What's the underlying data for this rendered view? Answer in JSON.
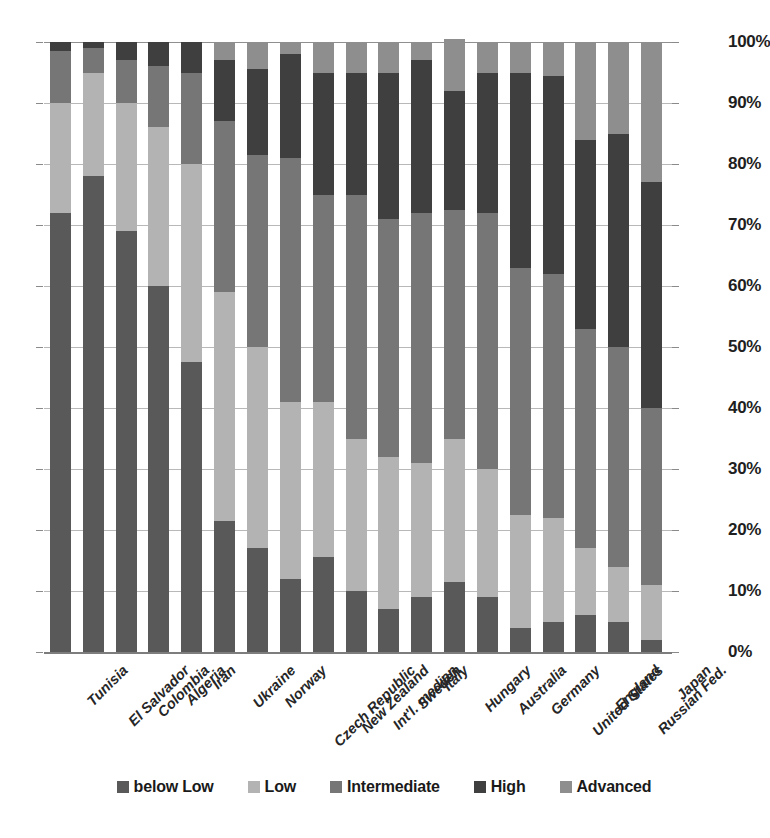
{
  "chart_data": {
    "type": "bar",
    "subtype": "stacked-100-percent",
    "title": "",
    "xlabel": "",
    "ylabel": "",
    "ylim": [
      0,
      100
    ],
    "ytick_labels": [
      "100%",
      "90%",
      "80%",
      "70%",
      "60%",
      "50%",
      "40%",
      "30%",
      "20%",
      "10%",
      "0%"
    ],
    "ytick_values": [
      100,
      90,
      80,
      70,
      60,
      50,
      40,
      30,
      20,
      10,
      0
    ],
    "grid": true,
    "legend_position": "bottom",
    "categories": [
      "Tunisia",
      "El Salvador",
      "Colombia",
      "Algeria",
      "Iran",
      "Ukraine",
      "Norway",
      "Czech Republic",
      "New Zealand",
      "Int'l. median",
      "Sweden",
      "Italy",
      "Hungary",
      "Australia",
      "Germany",
      "United States",
      "England",
      "Russian Fed.",
      "Japan"
    ],
    "series": [
      {
        "name": "below Low",
        "color": "#595959",
        "values": [
          72,
          78,
          69,
          60,
          47.5,
          21.5,
          17,
          12,
          15.5,
          10,
          7,
          9,
          11.5,
          9,
          4,
          5,
          6,
          5,
          2
        ]
      },
      {
        "name": "Low",
        "color": "#b3b3b3",
        "values": [
          18,
          17,
          21,
          26,
          32.5,
          37.5,
          33,
          29,
          25.5,
          25,
          25,
          22,
          23.5,
          21,
          18.5,
          17,
          11,
          9,
          9
        ]
      },
      {
        "name": "Intermediate",
        "color": "#767676",
        "values": [
          8.5,
          4,
          7,
          10,
          15,
          28,
          31.5,
          40,
          34,
          40,
          39,
          41,
          37.5,
          42,
          40.5,
          40,
          36,
          36,
          29
        ]
      },
      {
        "name": "High",
        "color": "#3f3f3f",
        "values": [
          1.5,
          1,
          3,
          4,
          5,
          10,
          14,
          17,
          20,
          20,
          24,
          25,
          19.5,
          23,
          32,
          32.5,
          31,
          35,
          37
        ]
      },
      {
        "name": "Advanced",
        "color": "#8e8e8e",
        "values": [
          0,
          0,
          0,
          0,
          0,
          3,
          4.5,
          2,
          5,
          5,
          5,
          3,
          8.5,
          5,
          5,
          5.5,
          16,
          15,
          23
        ]
      }
    ]
  }
}
